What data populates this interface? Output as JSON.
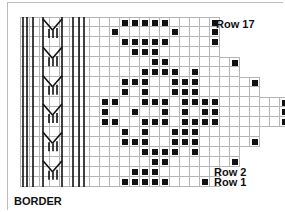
{
  "labels": {
    "row_top": "Row 17",
    "row_2": "Row 2",
    "row_1": "Row 1",
    "border": "BORDER"
  },
  "colors": {
    "ink": "#111111",
    "gridline": "#b5b5b5",
    "background": "#ffffff"
  },
  "grid": {
    "cell_size": 10,
    "origin_x": 20,
    "origin_y": 17,
    "border_columns": 8,
    "rows_total": 17,
    "rows": [
      {
        "row": 17,
        "width": 12,
        "filled": [
          2,
          3,
          4,
          5,
          6,
          11
        ]
      },
      {
        "row": 16,
        "width": 12,
        "filled": [
          1,
          7,
          11
        ]
      },
      {
        "row": 15,
        "width": 12,
        "filled": [
          2,
          3,
          4,
          5,
          6,
          11
        ]
      },
      {
        "row": 14,
        "width": 12,
        "filled": [
          3,
          4,
          5
        ]
      },
      {
        "row": 13,
        "width": 14,
        "filled": [
          5,
          6,
          13
        ]
      },
      {
        "row": 12,
        "width": 14,
        "filled": [
          4,
          5,
          6,
          7,
          9
        ]
      },
      {
        "row": 11,
        "width": 16,
        "filled": [
          2,
          3,
          4,
          7,
          8,
          9,
          15
        ]
      },
      {
        "row": 10,
        "width": 16,
        "filled": [
          2,
          4,
          7,
          8,
          9
        ]
      },
      {
        "row": 9,
        "width": 19,
        "filled": [
          0,
          1,
          4,
          5,
          6,
          8,
          9,
          10,
          11,
          18
        ]
      },
      {
        "row": 8,
        "width": 19,
        "filled": [
          0,
          3,
          6,
          8,
          10,
          11,
          18
        ]
      },
      {
        "row": 7,
        "width": 19,
        "filled": [
          0,
          1,
          4,
          5,
          6,
          8,
          9,
          10,
          11,
          18
        ]
      },
      {
        "row": 6,
        "width": 16,
        "filled": [
          2,
          4,
          7,
          8,
          9
        ]
      },
      {
        "row": 5,
        "width": 16,
        "filled": [
          2,
          3,
          4,
          7,
          8,
          9,
          15
        ]
      },
      {
        "row": 4,
        "width": 14,
        "filled": [
          4,
          5,
          6,
          7,
          9
        ]
      },
      {
        "row": 3,
        "width": 14,
        "filled": [
          5,
          6,
          13
        ]
      },
      {
        "row": 2,
        "width": 12,
        "filled": [
          3,
          4,
          5
        ]
      },
      {
        "row": 1,
        "width": 12,
        "filled": [
          2,
          3,
          4,
          5,
          6,
          10
        ]
      }
    ]
  },
  "border_motif": {
    "symbol": "cable-V-motif",
    "repeat_count": 6
  }
}
